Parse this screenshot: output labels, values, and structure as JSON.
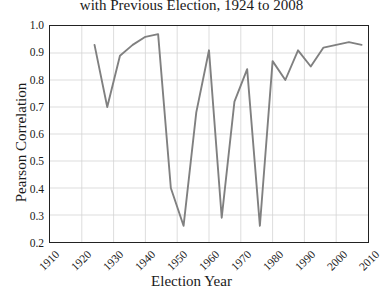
{
  "chart_data": {
    "type": "line",
    "title": "with Previous Election, 1924 to 2008",
    "xlabel": "Election Year",
    "ylabel": "Pearson Correlation",
    "xlim": [
      1910,
      2010
    ],
    "ylim": [
      0.2,
      1.0
    ],
    "grid": true,
    "legend": false,
    "line_color": "#808080",
    "x_ticks": [
      1910,
      1920,
      1930,
      1940,
      1950,
      1960,
      1970,
      1980,
      1990,
      2000,
      2010
    ],
    "x_tick_labels": [
      "1910",
      "1920",
      "1930",
      "1940",
      "1950",
      "1960",
      "1970",
      "1980",
      "1990",
      "2000",
      "2010"
    ],
    "y_ticks": [
      0.2,
      0.3,
      0.4,
      0.5,
      0.6,
      0.7,
      0.8,
      0.9,
      1.0
    ],
    "y_tick_labels": [
      "0.2",
      "0.3",
      "0.4",
      "0.5",
      "0.6",
      "0.7",
      "0.8",
      "0.9",
      "1.0"
    ],
    "x": [
      1924,
      1928,
      1932,
      1936,
      1940,
      1944,
      1948,
      1952,
      1956,
      1960,
      1964,
      1968,
      1972,
      1976,
      1980,
      1984,
      1988,
      1992,
      1996,
      2000,
      2004,
      2008
    ],
    "values": [
      0.93,
      0.7,
      0.89,
      0.93,
      0.96,
      0.97,
      0.4,
      0.26,
      0.68,
      0.91,
      0.29,
      0.72,
      0.84,
      0.26,
      0.87,
      0.8,
      0.91,
      0.85,
      0.92,
      0.93,
      0.94,
      0.93
    ],
    "series": [
      {
        "name": "Pearson correlation with previous election",
        "values": [
          0.93,
          0.7,
          0.89,
          0.93,
          0.96,
          0.97,
          0.4,
          0.26,
          0.68,
          0.91,
          0.29,
          0.72,
          0.84,
          0.26,
          0.87,
          0.8,
          0.91,
          0.85,
          0.92,
          0.93,
          0.94,
          0.93
        ]
      }
    ]
  }
}
